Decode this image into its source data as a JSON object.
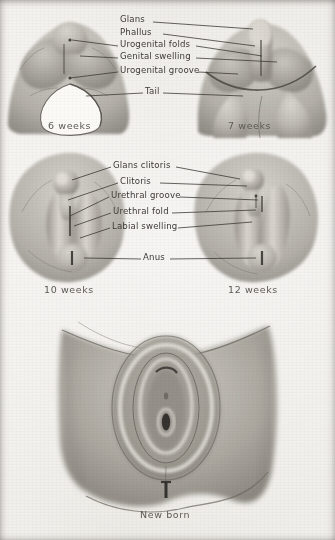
{
  "plate": {
    "title": "Development of the external genitalia",
    "style": "grayscale anatomical wash drawing",
    "background_color": "#f2f0ec",
    "ink_color": "#3e3b37"
  },
  "stages": [
    {
      "id": "six-weeks",
      "caption": "6 weeks",
      "caption_x": 48,
      "caption_y": 126
    },
    {
      "id": "seven-weeks",
      "caption": "7 weeks",
      "caption_x": 228,
      "caption_y": 126
    },
    {
      "id": "ten-weeks",
      "caption": "10 weeks",
      "caption_x": 44,
      "caption_y": 290
    },
    {
      "id": "twelve-weeks",
      "caption": "12 weeks",
      "caption_x": 228,
      "caption_y": 290
    },
    {
      "id": "new-born",
      "caption": "New born",
      "caption_x": 140,
      "caption_y": 515
    }
  ],
  "labels_top": [
    {
      "text": "Glans",
      "x": 120,
      "y": 19
    },
    {
      "text": "Phallus",
      "x": 120,
      "y": 31
    },
    {
      "text": "Urogenital folds",
      "x": 120,
      "y": 43
    },
    {
      "text": "Genital swelling",
      "x": 120,
      "y": 55
    },
    {
      "text": "Urogenital groove",
      "x": 120,
      "y": 71
    },
    {
      "text": "Tail",
      "x": 145,
      "y": 93
    }
  ],
  "labels_middle": [
    {
      "text": "Glans clitoris",
      "x": 113,
      "y": 166
    },
    {
      "text": "Clitoris",
      "x": 120,
      "y": 182
    },
    {
      "text": "Urethral groove",
      "x": 111,
      "y": 196
    },
    {
      "text": "Urethral fold",
      "x": 113,
      "y": 212
    },
    {
      "text": "Labial swelling",
      "x": 112,
      "y": 227
    },
    {
      "text": "Anus",
      "x": 143,
      "y": 258
    }
  ]
}
